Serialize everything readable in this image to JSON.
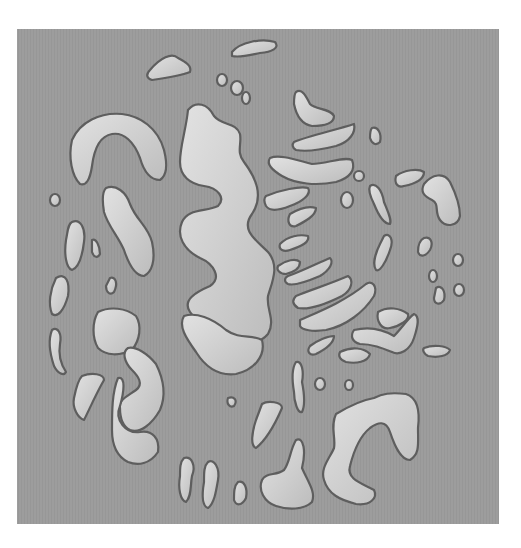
{
  "image": {
    "description": "Grayscale micrograph-like pattern of irregular light blobs with dark outlines on a medium gray square background",
    "colors": {
      "page_background": "#ffffff",
      "square_background": "#9c9c9c",
      "blob_fill_light": "#dcdcdc",
      "blob_fill_dark": "#bdbdbd",
      "blob_outline": "#5e5e5e"
    },
    "blob_count_approx": 70
  }
}
